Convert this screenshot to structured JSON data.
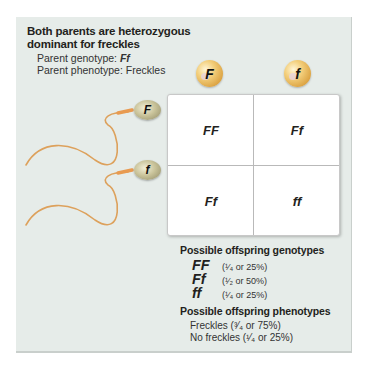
{
  "header": {
    "title_line1": "Both parents are heterozygous",
    "title_line2": "dominant for freckles",
    "genotype_label": "Parent genotype: ",
    "genotype_value": "Ff",
    "phenotype_line": "Parent phenotype: Freckles"
  },
  "eggs": [
    {
      "allele": "F"
    },
    {
      "allele": "f"
    }
  ],
  "sperm": [
    {
      "allele": "F"
    },
    {
      "allele": "f"
    }
  ],
  "punnett": {
    "cells": [
      [
        "FF",
        "Ff"
      ],
      [
        "Ff",
        "ff"
      ]
    ]
  },
  "genotypes": {
    "title": "Possible offspring genotypes",
    "items": [
      {
        "symbol": "FF",
        "fraction": "(¹⁄₄ or 25%)"
      },
      {
        "symbol": "Ff",
        "fraction": "(¹⁄₂ or 50%)"
      },
      {
        "symbol": "ff",
        "fraction": "(¹⁄₄ or 25%)"
      }
    ]
  },
  "phenotypes": {
    "title": "Possible offspring phenotypes",
    "items": [
      "Freckles (³⁄₄ or 75%)",
      "No freckles (¹⁄₄ or 25%)"
    ]
  },
  "colors": {
    "panel_bg": "#e6ece9",
    "egg": "#e8b75a",
    "sperm_tail": "#e0a25a",
    "grid_bg": "#ffffff"
  }
}
